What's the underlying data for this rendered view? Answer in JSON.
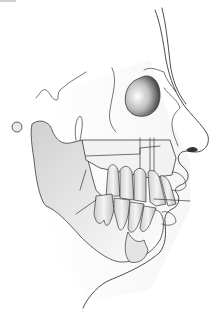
{
  "illustration": {
    "subject": "lateral view of face profile with maxilla, mandible and dentition",
    "colors": {
      "background": "#ffffff",
      "outline": "#3a3a3a",
      "shade_light": "#e6e6e6",
      "shade_mid": "#c8c8c8",
      "shade_dark": "#5a5a5a"
    }
  }
}
